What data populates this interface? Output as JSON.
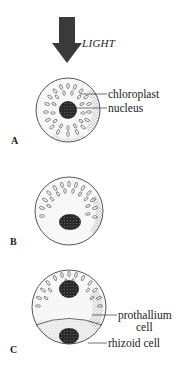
{
  "figure": {
    "light_label": "LIGHT",
    "panels": [
      {
        "id": "A",
        "label": "A"
      },
      {
        "id": "B",
        "label": "B"
      },
      {
        "id": "C",
        "label": "C"
      }
    ],
    "annotations": {
      "chloroplast": "chloroplast",
      "nucleus": "nucleus",
      "prothallium_line1": "prothallium",
      "prothallium_line2": "cell",
      "rhizoid": "rhizoid cell"
    }
  }
}
